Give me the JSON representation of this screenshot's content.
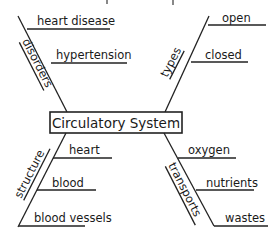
{
  "diagram": {
    "type": "spider-map",
    "center": {
      "label": "Circulatory System"
    },
    "branches": [
      {
        "category": "disorders",
        "position": "top-left",
        "details": [
          "heart disease",
          "hypertension"
        ]
      },
      {
        "category": "types",
        "position": "top-right",
        "details": [
          "open",
          "closed"
        ]
      },
      {
        "category": "structure",
        "position": "bottom-left",
        "details": [
          "heart",
          "blood",
          "blood vessels"
        ]
      },
      {
        "category": "transports",
        "position": "bottom-right",
        "details": [
          "oxygen",
          "nutrients",
          "wastes"
        ]
      }
    ],
    "colors": {
      "line": "#222222",
      "text": "#1a1a1a",
      "background": "#ffffff"
    }
  }
}
